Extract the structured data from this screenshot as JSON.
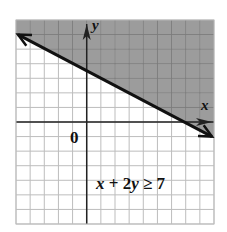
{
  "chart_data": {
    "type": "line",
    "title": "",
    "xlabel": "x",
    "ylabel": "y",
    "origin_label": "0",
    "xlim": [
      -5,
      9
    ],
    "ylim": [
      -7,
      7
    ],
    "grid": true,
    "grid_step": 1,
    "boundary_line": {
      "equation": "x + 2y = 7",
      "style": "solid",
      "points": [
        {
          "x": -5,
          "y": 6
        },
        {
          "x": 9,
          "y": -1
        }
      ],
      "y_intercept": 3.5,
      "x_intercept": 7
    },
    "inequality": "x + 2y ≥ 7",
    "shaded_region": "above",
    "annotations": [
      {
        "text": "x + 2y ≥ 7",
        "x": 4,
        "y": -4.8
      }
    ]
  },
  "colors": {
    "shade": "#9c9c9c",
    "grid": "#bdbdbd",
    "grid_on_shade": "#7c7c7c",
    "axis": "#222222",
    "line": "#111111"
  },
  "labels": {
    "x_axis": "x",
    "y_axis": "y",
    "origin": "0",
    "inequality": "x + 2y ≥ 7"
  }
}
